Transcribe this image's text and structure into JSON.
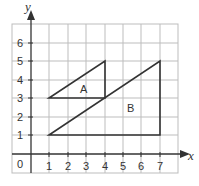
{
  "diagram": {
    "type": "coordinate-grid",
    "axes": {
      "x_label": "x",
      "y_label": "y",
      "origin_label": "0",
      "x_ticks": [
        "1",
        "2",
        "3",
        "4",
        "5",
        "6",
        "7"
      ],
      "y_ticks": [
        "1",
        "2",
        "3",
        "4",
        "5",
        "6"
      ]
    },
    "shapes": [
      {
        "name": "A",
        "vertices": [
          [
            1,
            3
          ],
          [
            4,
            3
          ],
          [
            4,
            5
          ]
        ]
      },
      {
        "name": "B",
        "vertices": [
          [
            1,
            1
          ],
          [
            7,
            1
          ],
          [
            7,
            5
          ]
        ]
      }
    ],
    "colors": {
      "grid": "#bdbdbd",
      "axis": "#333333",
      "shape_stroke": "#333333"
    }
  }
}
